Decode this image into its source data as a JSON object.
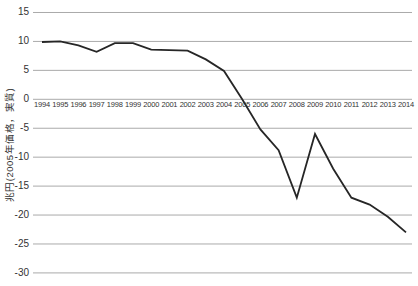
{
  "chart_data": {
    "type": "line",
    "title": "",
    "xlabel": "",
    "ylabel": "兆円(2005年価格，実質)",
    "x": [
      1994,
      1995,
      1996,
      1997,
      1998,
      1999,
      2000,
      2001,
      2002,
      2003,
      2004,
      2005,
      2006,
      2007,
      2008,
      2009,
      2010,
      2011,
      2012,
      2013,
      2014
    ],
    "values": [
      9.9,
      10.0,
      9.3,
      8.2,
      9.7,
      9.7,
      8.6,
      8.5,
      8.4,
      6.9,
      4.9,
      0.0,
      -5.2,
      -8.8,
      -17.0,
      -6.0,
      -12.0,
      -17.0,
      -18.2,
      -20.3,
      -23.0
    ],
    "ylim": [
      -30,
      15
    ],
    "y_ticks": [
      15,
      10,
      5,
      0,
      -5,
      -10,
      -15,
      -20,
      -25,
      -30
    ],
    "grid": "horizontal-only",
    "legend": "none",
    "colors": {
      "line": "#262626",
      "grid": "#aaaaaa",
      "text": "#333333",
      "background": "#ffffff"
    },
    "layout": {
      "x0": 42,
      "x_step": 18.2,
      "y_zero": 99.3,
      "px_per_unit": 5.787,
      "grid_x1": 33,
      "grid_x2": 412,
      "line_width": 1.8,
      "ylab_right": 29,
      "xlab_top": 99.5
    }
  }
}
